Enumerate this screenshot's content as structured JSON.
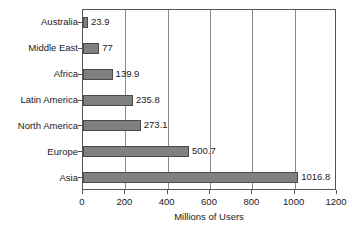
{
  "chart_data": {
    "type": "bar",
    "orientation": "horizontal",
    "title": "",
    "subtitle": "",
    "xlabel": "Millions of Users",
    "ylabel": "",
    "categories": [
      "Australia",
      "Middle East",
      "Africa",
      "Latin America",
      "North America",
      "Europe",
      "Asia"
    ],
    "values": [
      23.9,
      77,
      139.9,
      235.8,
      273.1,
      500.7,
      1016.8
    ],
    "value_labels": [
      "23.9",
      "77",
      "139.9",
      "235.8",
      "273.1",
      "500.7",
      "1016.8"
    ],
    "series": [
      {
        "name": "Millions of Users",
        "values": [
          23.9,
          77,
          139.9,
          235.8,
          273.1,
          500.7,
          1016.8
        ]
      }
    ],
    "xlim": [
      0,
      1200
    ],
    "xticks": [
      0,
      200,
      400,
      600,
      800,
      1000,
      1200
    ],
    "xtick_labels": [
      "0",
      "200",
      "400",
      "600",
      "800",
      "1000",
      "1200"
    ],
    "grid": "vertical",
    "legend": "none",
    "bar_fill_color": "#808080",
    "bar_border_color": "#4a4a4a",
    "gridline_color": "#8a8a8a",
    "axis_color": "#555555",
    "background_color": "#ffffff",
    "data_labels_shown": true
  }
}
